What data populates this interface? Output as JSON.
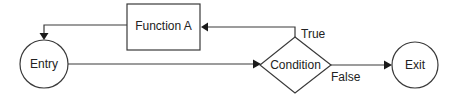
{
  "diagram": {
    "type": "flowchart",
    "nodes": [
      {
        "id": "entry",
        "shape": "circle",
        "label": "Entry"
      },
      {
        "id": "function_a",
        "shape": "rectangle",
        "label": "Function A"
      },
      {
        "id": "condition",
        "shape": "diamond",
        "label": "Condition"
      },
      {
        "id": "exit",
        "shape": "circle",
        "label": "Exit"
      }
    ],
    "edges": [
      {
        "from": "entry",
        "to": "condition",
        "label": ""
      },
      {
        "from": "condition",
        "to": "function_a",
        "label": "True"
      },
      {
        "from": "function_a",
        "to": "entry",
        "label": ""
      },
      {
        "from": "condition",
        "to": "exit",
        "label": "False"
      }
    ],
    "edge_labels": {
      "true": "True",
      "false": "False"
    }
  },
  "colors": {
    "stroke": "#3a3a3a",
    "arrow": "#1a1a1a",
    "text": "#222222",
    "background": "#ffffff"
  }
}
